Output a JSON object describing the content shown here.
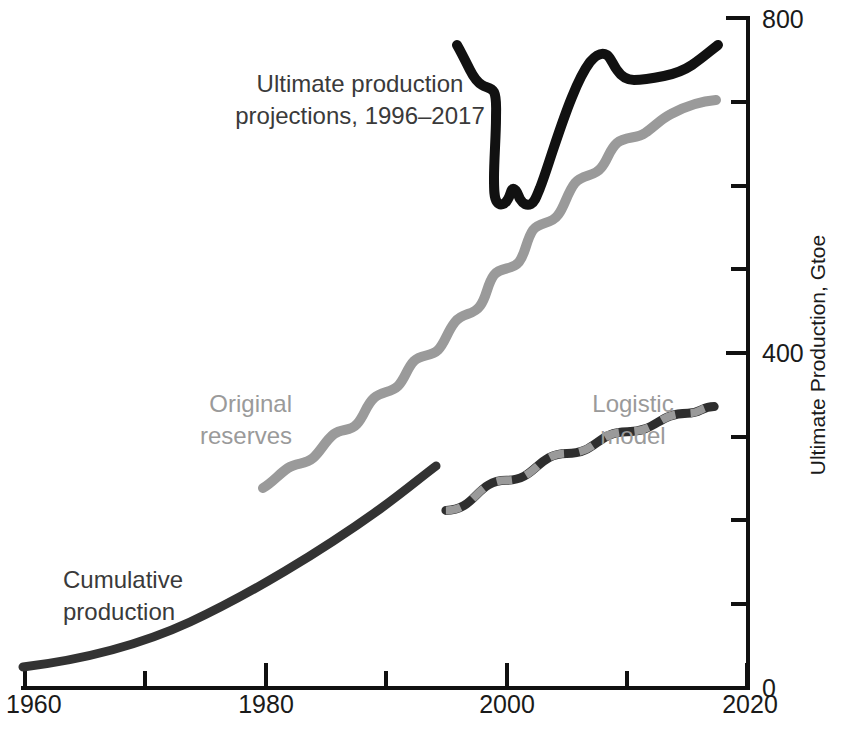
{
  "chart_data": {
    "type": "line",
    "title": "",
    "xlabel": "",
    "ylabel": "Ultimate Production, Gtoe",
    "xlim": [
      1960,
      2020
    ],
    "ylim": [
      0,
      800
    ],
    "grid": false,
    "legend_position": "inline-annotations",
    "x_ticks_major": [
      "1960",
      "1980",
      "2000",
      "2020"
    ],
    "x_ticks_major_values": [
      1960,
      1980,
      2000,
      2020
    ],
    "x_ticks_minor_values": [
      1970,
      1990,
      2010
    ],
    "y_ticks_major": [
      "0",
      "400",
      "800"
    ],
    "y_ticks_major_values": [
      0,
      400,
      800
    ],
    "y_ticks_minor_values": [
      100,
      200,
      300,
      500,
      600,
      700
    ],
    "series": [
      {
        "name": "Ultimate production projections, 1996–2017",
        "color": "#111111",
        "style": "solid",
        "x": [
          1995.1,
          1995.8,
          1996.4,
          1996.8,
          1997.4,
          1997.9,
          1998.4,
          1999.0,
          1999.6,
          2000.2,
          2000.8,
          2001.4,
          2002.0,
          2002.6,
          2003.4,
          2004.2,
          2005.0,
          2005.8,
          2006.6,
          2007.3,
          2008.0,
          2008.7,
          2009.5,
          2010.5,
          2011.6,
          2012.8,
          2014.0,
          2015.2,
          2016.3,
          2017.2
        ],
        "y": [
          762,
          740,
          720,
          712,
          710,
          700,
          660,
          620,
          600,
          597,
          612,
          607,
          595,
          597,
          632,
          668,
          700,
          722,
          738,
          748,
          752,
          742,
          725,
          713,
          708,
          707,
          709,
          716,
          731,
          749
        ]
      },
      {
        "name": "Original reserves",
        "color": "#9a9a9a",
        "style": "solid",
        "x": [
          1980.0,
          1981.0,
          1982.0,
          1983.0,
          1984.0,
          1985.0,
          1986.0,
          1987.0,
          1988.0,
          1989.0,
          1990.0,
          1991.0,
          1992.0,
          1993.0,
          1994.0,
          1995.0,
          1996.0,
          1997.0,
          1998.0,
          1999.0,
          2000.0,
          2001.0,
          2002.0,
          2003.0,
          2004.0,
          2005.0,
          2006.0,
          2007.0,
          2008.0,
          2009.0,
          2010.0,
          2011.0,
          2012.0,
          2013.0,
          2014.0,
          2015.0,
          2016.0,
          2017.2
        ],
        "y": [
          238,
          248,
          258,
          262,
          272,
          286,
          292,
          302,
          316,
          322,
          334,
          348,
          352,
          366,
          382,
          386,
          402,
          420,
          432,
          436,
          452,
          470,
          484,
          488,
          500,
          516,
          528,
          534,
          548,
          568,
          588,
          600,
          612,
          624,
          640,
          652,
          664,
          700
        ]
      },
      {
        "name": "Cumulative production",
        "color": "#333333",
        "style": "solid",
        "x": [
          1960,
          1965,
          1970,
          1975,
          1980,
          1985,
          1990,
          1995
        ],
        "y": [
          24,
          38,
          58,
          82,
          110,
          140,
          175,
          212
        ]
      },
      {
        "name": "Logistic model",
        "color": "#9a9a9a",
        "style": "dashed-over-dark",
        "x": [
          1995,
          2000,
          2005,
          2010,
          2015,
          2017.2
        ],
        "y": [
          212,
          248,
          280,
          306,
          328,
          336
        ]
      }
    ],
    "annotations": [
      {
        "text": "Ultimate production\nprojections, 1996–2017",
        "color": "#3a3a3a"
      },
      {
        "text": "Original\nreserves",
        "color": "#9a9a9a"
      },
      {
        "text": "Logistic\nmodel",
        "color": "#9a9a9a"
      },
      {
        "text": "Cumulative\nproduction",
        "color": "#3a3a3a"
      }
    ]
  },
  "axes": {
    "y_axis_title": "Ultimate Production, Gtoe",
    "x_tick_1960": "1960",
    "x_tick_1980": "1980",
    "x_tick_2000": "2000",
    "x_tick_2020": "2020",
    "y_tick_0": "0",
    "y_tick_400": "400",
    "y_tick_800": "800"
  },
  "annotations": {
    "projections_line1": "Ultimate production",
    "projections_line2": "projections, 1996–2017",
    "reserves_line1": "Original",
    "reserves_line2": "reserves",
    "logistic_line1": "Logistic",
    "logistic_line2": "model",
    "cumulative_line1": "Cumulative",
    "cumulative_line2": "production"
  },
  "colors": {
    "projections": "#111111",
    "reserves": "#9a9a9a",
    "cumulative": "#333333",
    "logistic_dash": "#9a9a9a",
    "axis": "#111111",
    "background": "#ffffff"
  }
}
